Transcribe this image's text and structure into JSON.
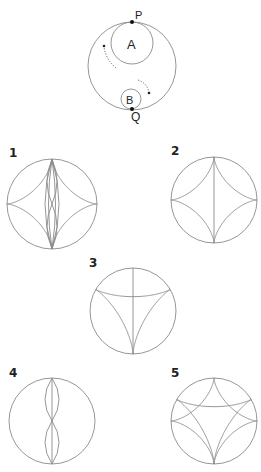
{
  "figure": {
    "setup": {
      "outer_circle": {
        "cx": 132,
        "cy": 66,
        "r": 44
      },
      "circle_a": {
        "label": "A",
        "cx": 132,
        "cy": 43,
        "r": 21
      },
      "circle_b": {
        "label": "B",
        "cx": 131,
        "cy": 99,
        "r": 10
      },
      "point_p": {
        "label": "P",
        "x": 132,
        "y": 22
      },
      "point_q": {
        "label": "Q",
        "x": 132,
        "y": 109
      },
      "rotation_arrows": [
        "clockwise-left-arrow",
        "clockwise-right-arrow"
      ]
    },
    "options": [
      {
        "label": "1",
        "cx": 52,
        "cy": 204,
        "r": 45,
        "curves": "astroid + two vertical lens curves"
      },
      {
        "label": "2",
        "cx": 214,
        "cy": 200,
        "r": 43,
        "curves": "astroid + vertical diameter"
      },
      {
        "label": "3",
        "cx": 133,
        "cy": 311,
        "r": 43,
        "curves": "deltoid + vertical line"
      },
      {
        "label": "4",
        "cx": 52,
        "cy": 421,
        "r": 43,
        "curves": "two stacked lenses + vertical line"
      },
      {
        "label": "5",
        "cx": 214,
        "cy": 421,
        "r": 43,
        "curves": "astroid + deltoid"
      }
    ],
    "colors": {
      "stroke": "#8a8a8a",
      "text": "#222222",
      "point": "#111111"
    }
  }
}
